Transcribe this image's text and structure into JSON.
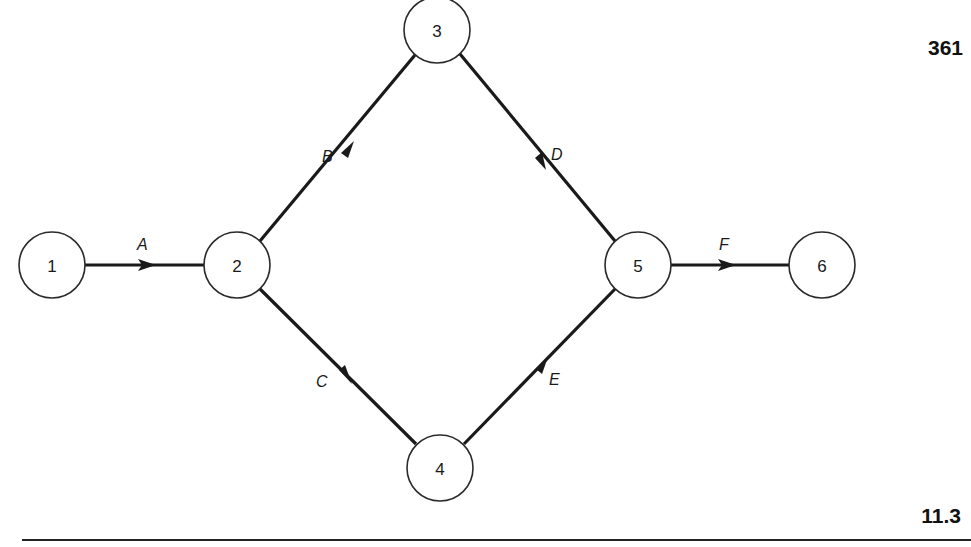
{
  "page": {
    "page_number": "361",
    "section_number": "11.3"
  },
  "diagram": {
    "type": "activity-on-arrow network",
    "nodes": [
      {
        "id": "1",
        "label": "1",
        "cx": 52,
        "cy": 265
      },
      {
        "id": "2",
        "label": "2",
        "cx": 237,
        "cy": 265
      },
      {
        "id": "3",
        "label": "3",
        "cx": 437,
        "cy": 30
      },
      {
        "id": "4",
        "label": "4",
        "cx": 440,
        "cy": 468
      },
      {
        "id": "5",
        "label": "5",
        "cx": 638,
        "cy": 265
      },
      {
        "id": "6",
        "label": "6",
        "cx": 822,
        "cy": 265
      }
    ],
    "edges": [
      {
        "label": "A",
        "from": "1",
        "to": "2"
      },
      {
        "label": "B",
        "from": "2",
        "to": "3"
      },
      {
        "label": "C",
        "from": "2",
        "to": "4"
      },
      {
        "label": "D",
        "from": "3",
        "to": "5"
      },
      {
        "label": "E",
        "from": "4",
        "to": "5"
      },
      {
        "label": "F",
        "from": "5",
        "to": "6"
      }
    ]
  }
}
